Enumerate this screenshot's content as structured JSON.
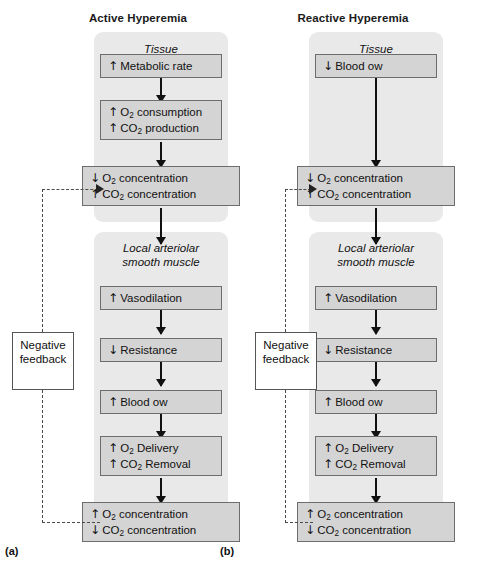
{
  "figure": {
    "panel_a": {
      "title": "Active Hyperemia",
      "caption": "(a)",
      "tissue_heading": "Tissue",
      "muscle_heading_line1": "Local arteriolar",
      "muscle_heading_line2": "smooth muscle",
      "feedback_label_line1": "Negative",
      "feedback_label_line2": "feedback",
      "steps": [
        {
          "id": "a1",
          "lines": [
            {
              "arrow": "↑",
              "text": "Metabolic rate"
            }
          ]
        },
        {
          "id": "a2",
          "lines": [
            {
              "arrow": "↑",
              "text": "O2 consumption"
            },
            {
              "arrow": "↑",
              "text": "CO2 production"
            }
          ]
        },
        {
          "id": "a3",
          "lines": [
            {
              "arrow": "↓",
              "text": "O2 concentration"
            },
            {
              "arrow": "↑",
              "text": "CO2 concentration"
            }
          ]
        },
        {
          "id": "a4",
          "lines": [
            {
              "arrow": "↑",
              "text": "Vasodilation"
            }
          ]
        },
        {
          "id": "a5",
          "lines": [
            {
              "arrow": "↓",
              "text": "Resistance"
            }
          ]
        },
        {
          "id": "a6",
          "lines": [
            {
              "arrow": "↑",
              "text": "Blood  ow"
            }
          ]
        },
        {
          "id": "a7",
          "lines": [
            {
              "arrow": "↑",
              "text": "O2 Delivery"
            },
            {
              "arrow": "↑",
              "text": "CO2 Removal"
            }
          ]
        },
        {
          "id": "a8",
          "lines": [
            {
              "arrow": "↑",
              "text": "O2 concentration"
            },
            {
              "arrow": "↓",
              "text": "CO2 concentration"
            }
          ]
        }
      ]
    },
    "panel_b": {
      "title": "Reactive Hyperemia",
      "caption": "(b)",
      "tissue_heading": "Tissue",
      "muscle_heading_line1": "Local arteriolar",
      "muscle_heading_line2": "smooth muscle",
      "feedback_label_line1": "Negative",
      "feedback_label_line2": "feedback",
      "steps": [
        {
          "id": "b1",
          "lines": [
            {
              "arrow": "↓",
              "text": "Blood  ow"
            }
          ]
        },
        {
          "id": "b3",
          "lines": [
            {
              "arrow": "↓",
              "text": "O2 concentration"
            },
            {
              "arrow": "↑",
              "text": "CO2 concentration"
            }
          ]
        },
        {
          "id": "b4",
          "lines": [
            {
              "arrow": "↑",
              "text": "Vasodilation"
            }
          ]
        },
        {
          "id": "b5",
          "lines": [
            {
              "arrow": "↓",
              "text": "Resistance"
            }
          ]
        },
        {
          "id": "b6",
          "lines": [
            {
              "arrow": "↑",
              "text": "Blood  ow"
            }
          ]
        },
        {
          "id": "b7",
          "lines": [
            {
              "arrow": "↑",
              "text": "O2 Delivery"
            },
            {
              "arrow": "↑",
              "text": "CO2 Removal"
            }
          ]
        },
        {
          "id": "b8",
          "lines": [
            {
              "arrow": "↑",
              "text": "O2 concentration"
            },
            {
              "arrow": "↓",
              "text": "CO2 concentration"
            }
          ]
        }
      ]
    },
    "colors": {
      "panel_background": "#e9e9e9",
      "box_fill": "#d4d4d4",
      "box_border": "#6d6d6d",
      "arrow": "#111111",
      "dashed_feedback": "#4a4a4a"
    }
  }
}
